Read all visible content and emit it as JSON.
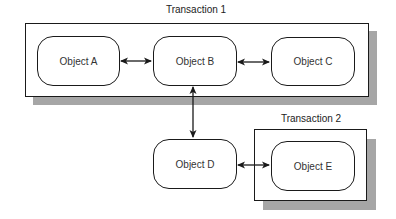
{
  "diagram": {
    "transactions": [
      {
        "id": "t1",
        "label": "Transaction 1"
      },
      {
        "id": "t2",
        "label": "Transaction 2"
      }
    ],
    "objects": [
      {
        "id": "A",
        "label": "Object A",
        "transaction": "Transaction 1"
      },
      {
        "id": "B",
        "label": "Object B",
        "transaction": "Transaction 1"
      },
      {
        "id": "C",
        "label": "Object C",
        "transaction": "Transaction 1"
      },
      {
        "id": "D",
        "label": "Object D",
        "transaction": null
      },
      {
        "id": "E",
        "label": "Object E",
        "transaction": "Transaction 2"
      }
    ],
    "connections": [
      {
        "from": "Object A",
        "to": "Object B",
        "type": "bidirectional"
      },
      {
        "from": "Object B",
        "to": "Object C",
        "type": "bidirectional"
      },
      {
        "from": "Object B",
        "to": "Object D",
        "type": "bidirectional"
      },
      {
        "from": "Object D",
        "to": "Object E",
        "type": "bidirectional"
      }
    ],
    "colors": {
      "stroke": "#1a1a1a",
      "shadow": "#a6a6a6",
      "fill": "#ffffff"
    }
  }
}
